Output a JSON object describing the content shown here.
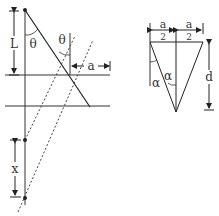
{
  "diagram": {
    "left_figure": {
      "labels": {
        "L": "L",
        "theta_1": "θ",
        "theta_2": "θ",
        "a": "a",
        "x": "x"
      }
    },
    "right_figure": {
      "labels": {
        "a_left_num": "a",
        "a_left_den": "2",
        "a_right_num": "a",
        "a_right_den": "2",
        "alpha_1": "α",
        "alpha_2": "α",
        "d": "d"
      }
    },
    "colors": {
      "line": "#222222",
      "dashed": "#444444",
      "background": "#ffffff"
    }
  }
}
